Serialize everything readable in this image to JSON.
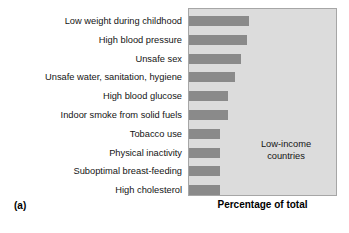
{
  "figure": {
    "panel_tag": "(a)",
    "annotation_line1": "Low-income",
    "annotation_line2": "countries"
  },
  "colors": {
    "bar": "#8a8a8a",
    "plot_background": "#dcdcdc",
    "plot_border": "#a6a6a6",
    "page_background": "#ffffff",
    "text": "#141414"
  },
  "chart_data": {
    "type": "bar",
    "orientation": "horizontal",
    "title": "",
    "subtitle": "",
    "xlabel": "Percentage of total",
    "ylabel": "",
    "annotation": "Low-income countries",
    "panel_label": "(a)",
    "grid": false,
    "legend": null,
    "axis_ticks_shown": false,
    "xlim": [
      0,
      10
    ],
    "categories": [
      "Low weight during childhood",
      "High blood pressure",
      "Unsafe sex",
      "Unsafe water, sanitation, hygiene",
      "High blood glucose",
      "Indoor smoke from solid fuels",
      "Tobacco use",
      "Physical inactivity",
      "Suboptimal breast-feeding",
      "High cholesterol"
    ],
    "values": [
      6.0,
      5.8,
      5.2,
      4.6,
      3.9,
      3.9,
      3.1,
      3.1,
      3.1,
      3.1
    ],
    "bar_pixel_widths": [
      60,
      58,
      52,
      46,
      39,
      39,
      31,
      31,
      31,
      31
    ]
  }
}
